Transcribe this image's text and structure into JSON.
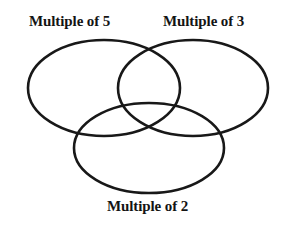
{
  "diagram": {
    "type": "venn-3-set",
    "background_color": "#ffffff",
    "stroke_color": "#181818",
    "stroke_width": 2.6,
    "sets": [
      {
        "id": "multiple-of-5",
        "label": "Multiple of 5",
        "position": "top-left",
        "cx": 104,
        "cy": 88,
        "rx": 76,
        "ry": 48
      },
      {
        "id": "multiple-of-3",
        "label": "Multiple of 3",
        "position": "top-right",
        "cx": 193,
        "cy": 88,
        "rx": 75,
        "ry": 48
      },
      {
        "id": "multiple-of-2",
        "label": "Multiple of 2",
        "position": "bottom-center",
        "cx": 149,
        "cy": 148,
        "rx": 75,
        "ry": 45
      }
    ],
    "regions": []
  }
}
